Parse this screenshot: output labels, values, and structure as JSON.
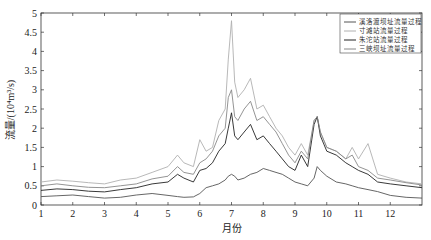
{
  "chart_data": {
    "type": "line",
    "title": "",
    "xlabel": "月份",
    "ylabel": "流量/(10⁴m³/s)",
    "xlim": [
      1,
      13
    ],
    "ylim": [
      0,
      5
    ],
    "x_ticks": [
      "1",
      "2",
      "3",
      "4",
      "5",
      "6",
      "7",
      "8",
      "9",
      "10",
      "11",
      "12"
    ],
    "y_ticks": [
      "0",
      "0.5",
      "1",
      "1.5",
      "2",
      "2.5",
      "3",
      "3.5",
      "4",
      "4.5",
      "5"
    ],
    "grid": false,
    "legend_position": "upper right",
    "x": [
      1.0,
      1.5,
      2.0,
      2.5,
      3.0,
      3.5,
      4.0,
      4.5,
      5.0,
      5.3,
      5.5,
      5.8,
      6.0,
      6.2,
      6.4,
      6.6,
      6.8,
      6.9,
      7.0,
      7.1,
      7.2,
      7.4,
      7.6,
      7.8,
      8.0,
      8.2,
      8.4,
      8.6,
      8.8,
      9.0,
      9.2,
      9.4,
      9.6,
      9.7,
      9.8,
      10.0,
      10.3,
      10.6,
      10.8,
      11.0,
      11.3,
      11.6,
      12.0,
      12.5,
      13.0
    ],
    "series": [
      {
        "name": "溪洛渡坝址流量过程",
        "color": "#555555",
        "values": [
          0.22,
          0.24,
          0.26,
          0.22,
          0.18,
          0.2,
          0.26,
          0.3,
          0.25,
          0.22,
          0.2,
          0.21,
          0.3,
          0.45,
          0.5,
          0.55,
          0.65,
          0.75,
          0.8,
          0.75,
          0.65,
          0.7,
          0.8,
          0.85,
          0.95,
          0.9,
          0.85,
          0.8,
          0.7,
          0.6,
          0.55,
          0.5,
          0.7,
          1.0,
          0.9,
          0.75,
          0.6,
          0.55,
          0.5,
          0.45,
          0.4,
          0.35,
          0.25,
          0.2,
          0.18
        ]
      },
      {
        "name": "寸滩站流量过程",
        "color": "#b0b0b0",
        "values": [
          0.6,
          0.65,
          0.62,
          0.58,
          0.55,
          0.65,
          0.7,
          0.85,
          1.0,
          1.3,
          1.1,
          1.0,
          1.7,
          1.4,
          1.5,
          2.2,
          2.5,
          3.8,
          4.8,
          3.2,
          2.8,
          3.0,
          3.3,
          2.5,
          2.6,
          2.3,
          2.0,
          1.8,
          1.5,
          1.3,
          1.6,
          1.3,
          2.2,
          2.3,
          1.9,
          1.5,
          1.4,
          1.2,
          1.5,
          1.2,
          1.6,
          0.8,
          0.7,
          0.6,
          0.55
        ]
      },
      {
        "name": "朱沱站流量过程",
        "color": "#222222",
        "values": [
          0.38,
          0.42,
          0.4,
          0.36,
          0.34,
          0.4,
          0.45,
          0.55,
          0.6,
          0.8,
          0.7,
          0.6,
          0.9,
          0.95,
          1.1,
          1.4,
          1.6,
          2.0,
          2.4,
          1.8,
          1.7,
          1.9,
          2.1,
          1.7,
          1.8,
          1.6,
          1.4,
          1.2,
          1.0,
          0.9,
          1.3,
          1.0,
          2.1,
          2.3,
          1.8,
          1.4,
          1.3,
          1.1,
          1.0,
          0.9,
          0.8,
          0.6,
          0.55,
          0.5,
          0.45
        ]
      },
      {
        "name": "三峡坝址流量过程",
        "color": "#888888",
        "values": [
          0.5,
          0.55,
          0.5,
          0.46,
          0.45,
          0.5,
          0.55,
          0.68,
          0.75,
          1.0,
          0.85,
          0.8,
          1.1,
          1.2,
          1.4,
          1.8,
          2.0,
          2.8,
          3.0,
          2.3,
          2.2,
          2.5,
          2.7,
          2.2,
          2.3,
          2.1,
          1.9,
          1.6,
          1.3,
          1.1,
          1.4,
          1.2,
          2.2,
          2.3,
          1.9,
          1.5,
          1.4,
          1.2,
          1.3,
          1.0,
          0.9,
          0.7,
          0.65,
          0.58,
          0.52
        ]
      }
    ]
  }
}
